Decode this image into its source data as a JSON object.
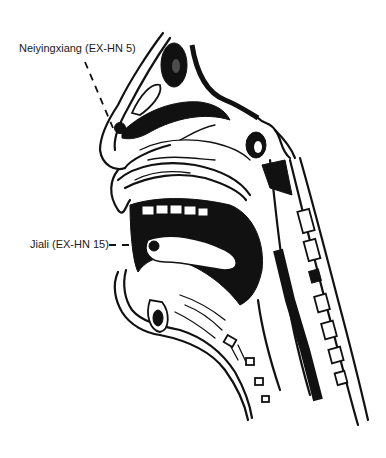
{
  "figure": {
    "type": "anatomical sagittal section of head and neck",
    "colors": {
      "ink": "#111111",
      "background": "#ffffff"
    }
  },
  "labels": [
    {
      "id": "neiyingxiang",
      "text": "Neiyingxiang (EX-HN 5)",
      "x": 19,
      "y": 42
    },
    {
      "id": "jiali",
      "text": "Jiali (EX-HN 15)",
      "x": 30,
      "y": 238
    }
  ]
}
